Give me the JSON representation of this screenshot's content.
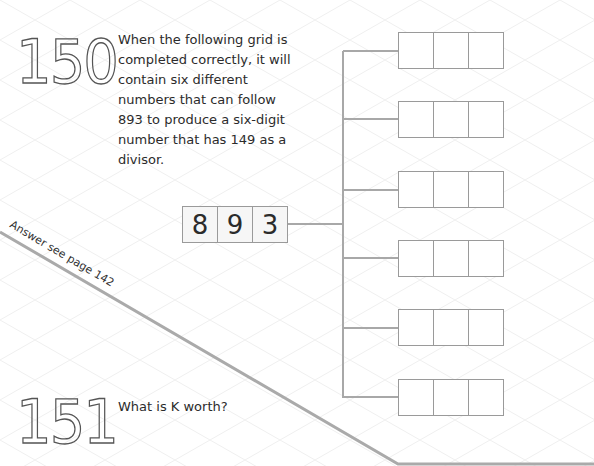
{
  "puzzle_150": {
    "number": "150",
    "text": "When the following grid is completed correctly, it will contain six different numbers that can follow 893 to produce a six-digit number that has 149 as a divisor.",
    "given_digits": [
      "8",
      "9",
      "3"
    ],
    "answer_rows": [
      [
        "",
        "",
        ""
      ],
      [
        "",
        "",
        ""
      ],
      [
        "",
        "",
        ""
      ],
      [
        "",
        "",
        ""
      ],
      [
        "",
        "",
        ""
      ],
      [
        "",
        "",
        ""
      ]
    ]
  },
  "answer_reference": "Answer see page 142",
  "puzzle_151": {
    "number": "151",
    "text": "What is K worth?"
  },
  "colors": {
    "line": "#a8a8a8",
    "cell_border": "#9a9a9a",
    "grid_bg": "#eeeeee"
  }
}
